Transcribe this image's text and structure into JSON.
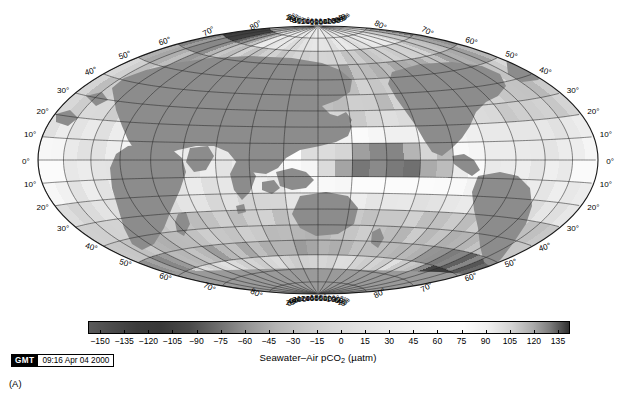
{
  "figure": {
    "panel_label": "(A)",
    "projection": "hammer",
    "central_meridian": 180
  },
  "map": {
    "longitude_labels_top": [
      "0°",
      "20°",
      "40°",
      "60°",
      "80°",
      "100°",
      "120°",
      "140°",
      "160°",
      "180°",
      "160°",
      "140°",
      "120°",
      "100°",
      "80°",
      "60°",
      "40°",
      "20°",
      "0°"
    ],
    "longitude_labels_bottom": [
      "0°",
      "20°",
      "40°",
      "60°",
      "80°",
      "100°",
      "120°",
      "140°",
      "160°",
      "180°",
      "160°",
      "140°",
      "120°",
      "100°",
      "80°",
      "60°",
      "40°",
      "20°",
      "0°"
    ],
    "latitude_labels_left": [
      "80°",
      "70°",
      "60°",
      "50°",
      "40°",
      "30°",
      "20°",
      "10°",
      "0°",
      "10°",
      "20°",
      "30°",
      "40°",
      "50°",
      "60°",
      "70°",
      "80°"
    ],
    "latitude_labels_right": [
      "80°",
      "70°",
      "60°",
      "50°",
      "40°",
      "30°",
      "20°",
      "10°",
      "0°",
      "10°",
      "20°",
      "30°",
      "40°",
      "50°",
      "60°",
      "70°",
      "80°"
    ],
    "pole_corner_labels": {
      "top_left": "80°",
      "top_right": "80°",
      "bottom_left": "80°",
      "bottom_right": "80°"
    },
    "grid_spacing_lon_deg": 20,
    "grid_spacing_lat_deg": 10,
    "land_color": "#8c8c8c",
    "grid_color": "#2b2b2b",
    "outline_color": "#1a1a1a"
  },
  "colorbar": {
    "ticks": [
      -150,
      -135,
      -120,
      -105,
      -90,
      -75,
      -60,
      -45,
      -30,
      -15,
      0,
      15,
      30,
      45,
      60,
      75,
      90,
      105,
      120,
      135
    ],
    "tick_labels": [
      "−150",
      "−135",
      "−120",
      "−105",
      "−90",
      "−75",
      "−60",
      "−45",
      "−30",
      "−15",
      "0",
      "15",
      "30",
      "45",
      "60",
      "75",
      "90",
      "105",
      "120",
      "135"
    ],
    "vmin": -157.5,
    "vmax": 142.5,
    "title_main": "Seawater–Air pCO",
    "title_sub": "2",
    "title_units": " (µatm)",
    "colormap": "gray-cyclic",
    "stops_hex": [
      "#5a5a5a",
      "#4a4a4a",
      "#3c3c3c",
      "#383838",
      "#4a4a4a",
      "#6e6e6e",
      "#959595",
      "#b4b4b4",
      "#c8c8c8",
      "#d6d6d6",
      "#e2e2e2",
      "#ececec",
      "#f4f4f4",
      "#fafafa",
      "#fdfdfd",
      "#f0f0f0",
      "#d4d4d4",
      "#ababab",
      "#7d7d7d",
      "#4e4e4e",
      "#2f2f2f"
    ]
  },
  "gmt_stamp": {
    "tag": "GMT",
    "datetime": "09:16 Apr 04 2000"
  },
  "chart_data": {
    "type": "heatmap",
    "title": "Seawater–Air pCO2 (µatm)",
    "xlabel": "Longitude",
    "ylabel": "Latitude",
    "xlim": [
      0,
      360
    ],
    "ylim": [
      -90,
      90
    ],
    "grid": true,
    "legend_position": "bottom",
    "colorbar_label": "Seawater–Air pCO2 (µatm)",
    "colorbar_range": [
      -150,
      135
    ],
    "colorbar_step": 15,
    "cell_size_deg": [
      10,
      10
    ],
    "regions": [
      {
        "name": "North Atlantic / Arctic (70-80N, 0-60E)",
        "value": -140
      },
      {
        "name": "Subpolar North Atlantic (50-70N)",
        "value": -60
      },
      {
        "name": "North Pacific subtropical gyre (20-40N)",
        "value": -30
      },
      {
        "name": "Equatorial Pacific (10S-10N, 150E-90W)",
        "value": 90
      },
      {
        "name": "Eastern equatorial Pacific (0-10S, 120-90W)",
        "value": 120
      },
      {
        "name": "Equatorial Atlantic (0-10S)",
        "value": 45
      },
      {
        "name": "Arabian Sea / N Indian Ocean",
        "value": 30
      },
      {
        "name": "Southern Ocean (40-60S)",
        "value": -30
      },
      {
        "name": "Antarctic margin South Atlantic (60-75S)",
        "value": -150
      },
      {
        "name": "Southern Indian Ocean (30-50S)",
        "value": -45
      },
      {
        "name": "Tropical South Pacific (10-25S)",
        "value": 15
      }
    ]
  }
}
